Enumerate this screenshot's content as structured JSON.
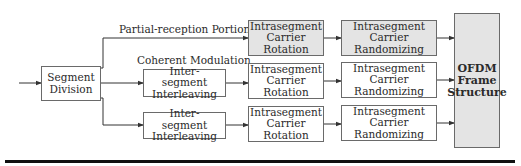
{
  "diagram": {
    "type": "block-diagram",
    "labels": {
      "partial_reception": "Partial-reception Portion",
      "coherent_modulation": "Coherent Modulation"
    },
    "blocks": {
      "segment_division": "Segment Division",
      "interleaving_row2": "Inter-segment Interleaving",
      "interleaving_row3": "Inter-segment Interleaving",
      "rotation_row1": "Intrasegment Carrier Rotation",
      "rotation_row2": "Intrasegment Carrier Rotation",
      "rotation_row3": "Intrasegment Carrier Rotation",
      "randomizing_row1": "Intrasegment Carrier Randomizing",
      "randomizing_row2": "Intrasegment Carrier Randomizing",
      "randomizing_row3": "Intrasegment Carrier Randomizing",
      "ofdm_frame": "OFDM Frame Structure"
    },
    "colors": {
      "shaded_fill": "#e4e4e4",
      "border": "#6a6a6a",
      "line": "#333333",
      "rule": "#111111"
    },
    "edges": [
      [
        "input",
        "Segment Division"
      ],
      [
        "Segment Division",
        "Intrasegment Carrier Rotation (row 1)"
      ],
      [
        "Segment Division",
        "Inter-segment Interleaving (row 2)"
      ],
      [
        "Segment Division",
        "Inter-segment Interleaving (row 3)"
      ],
      [
        "Inter-segment Interleaving (row 2)",
        "Intrasegment Carrier Rotation (row 2)"
      ],
      [
        "Inter-segment Interleaving (row 3)",
        "Intrasegment Carrier Rotation (row 3)"
      ],
      [
        "Intrasegment Carrier Rotation (row 1)",
        "Intrasegment Carrier Randomizing (row 1)"
      ],
      [
        "Intrasegment Carrier Rotation (row 2)",
        "Intrasegment Carrier Randomizing (row 2)"
      ],
      [
        "Intrasegment Carrier Rotation (row 3)",
        "Intrasegment Carrier Randomizing (row 3)"
      ],
      [
        "Intrasegment Carrier Randomizing (row 1)",
        "OFDM Frame Structure"
      ],
      [
        "Intrasegment Carrier Randomizing (row 2)",
        "OFDM Frame Structure"
      ],
      [
        "Intrasegment Carrier Randomizing (row 3)",
        "OFDM Frame Structure"
      ]
    ]
  }
}
